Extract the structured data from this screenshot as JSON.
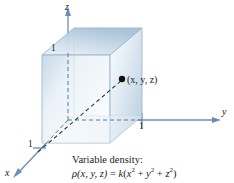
{
  "figure": {
    "background": "#ffffff"
  },
  "axes": {
    "z": {
      "label": "z",
      "tick": "1"
    },
    "y": {
      "label": "y",
      "tick": "1"
    },
    "x": {
      "label": "x",
      "tick": "1"
    }
  },
  "point": {
    "label": "(x, y, z)"
  },
  "caption": {
    "line1": "Variable density:",
    "rho": "ρ",
    "args": "(x, y, z)",
    "equals": " = ",
    "k": "k",
    "open": "(",
    "term1_base": "x",
    "term1_exp": "2",
    "plus1": " + ",
    "term2_base": "y",
    "term2_exp": "2",
    "plus2": " + ",
    "term3_base": "z",
    "term3_exp": "2",
    "close": ")"
  },
  "colors": {
    "axis": "#6a8fb5",
    "cube_edge": "#8fa9c4",
    "cube_light": "#f2f7fb",
    "cube_mid": "#cfdeeb",
    "cube_dark": "#a8c2d8",
    "text": "#1a1a1a",
    "dash": "#5d7f9e"
  }
}
